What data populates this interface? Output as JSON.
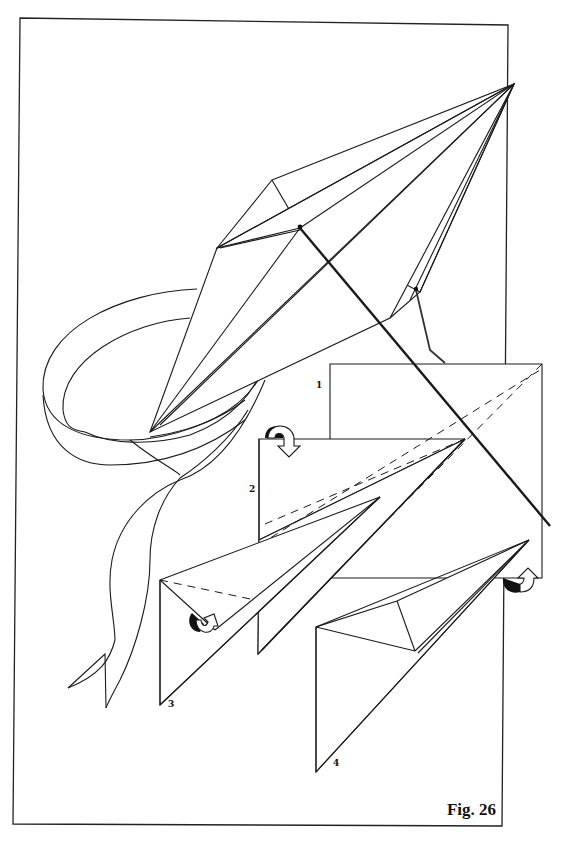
{
  "figure": {
    "caption": "Fig. 26",
    "frame_color": "#222222",
    "line_color": "#1a1a1a",
    "background": "#ffffff"
  },
  "steps": [
    {
      "label": "1",
      "description": "square sheet with diagonal fold line"
    },
    {
      "label": "2",
      "description": "fold sheet with fold-back arrow"
    },
    {
      "label": "3",
      "description": "triangle fold with turn arrow"
    },
    {
      "label": "4",
      "description": "finished kite shape"
    }
  ],
  "icons": {
    "fold_arrow": "curved-fold-arrow-icon"
  }
}
